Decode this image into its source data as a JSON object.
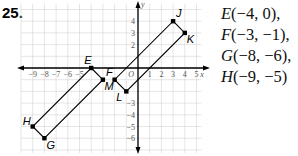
{
  "problem": {
    "number": "25."
  },
  "graph": {
    "origin_px": [
      138,
      68
    ],
    "unit_px": 11.7,
    "x_range": [
      -10,
      5.5
    ],
    "y_range": [
      -7,
      5.5
    ],
    "axis_labels": {
      "x": "x",
      "y": "y",
      "origin": "O"
    },
    "x_ticks": [
      -9,
      -8,
      -7,
      -6,
      -5,
      1,
      2,
      3,
      4,
      5
    ],
    "y_ticks": [
      4,
      3,
      2,
      -3,
      -4,
      -5,
      -6
    ],
    "shapes": [
      {
        "name": "EFGH",
        "points": [
          {
            "label": "E",
            "x": -4,
            "y": 0
          },
          {
            "label": "F",
            "x": -3,
            "y": -1
          },
          {
            "label": "G",
            "x": -8,
            "y": -6
          },
          {
            "label": "H",
            "x": -9,
            "y": -5
          }
        ]
      },
      {
        "name": "JKLM",
        "points": [
          {
            "label": "J",
            "x": 3,
            "y": 4
          },
          {
            "label": "K",
            "x": 4,
            "y": 3
          },
          {
            "label": "L",
            "x": -1,
            "y": -2
          },
          {
            "label": "M",
            "x": -2,
            "y": -1
          }
        ]
      }
    ]
  },
  "coordinates": [
    {
      "var": "E",
      "text": "(−4, 0),"
    },
    {
      "var": "F",
      "text": "(−3, −1),"
    },
    {
      "var": "G",
      "text": "(−8, −6),"
    },
    {
      "var": "H",
      "text": "(−9, −5)"
    }
  ]
}
